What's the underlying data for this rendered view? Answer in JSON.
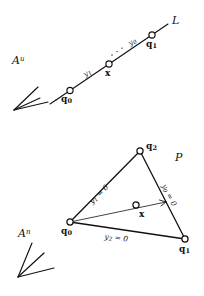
{
  "figure": {
    "ink_color": "#111111",
    "background_color": "#ffffff"
  },
  "top_panel": {
    "space_label": "A",
    "space_superscript": "u",
    "line_label": "L",
    "points": [
      {
        "name": "q0",
        "label": "q",
        "sub": "0"
      },
      {
        "name": "x",
        "label": "x",
        "sub": ""
      },
      {
        "name": "q1",
        "label": "q",
        "sub": "1"
      }
    ],
    "segment_labels": [
      {
        "name": "y1",
        "label": "y",
        "sub": "1"
      },
      {
        "name": "y0",
        "label": "y",
        "sub": "0"
      }
    ]
  },
  "bottom_panel": {
    "space_label": "A",
    "space_superscript": "n",
    "region_label": "P",
    "points": [
      {
        "name": "q0",
        "label": "q",
        "sub": "0"
      },
      {
        "name": "q1",
        "label": "q",
        "sub": "1"
      },
      {
        "name": "q2",
        "label": "q",
        "sub": "2"
      },
      {
        "name": "x",
        "label": "x",
        "sub": ""
      }
    ],
    "edge_labels": [
      {
        "name": "edge-q0-q2",
        "label": "y",
        "sub": "1",
        "equals": " = 0"
      },
      {
        "name": "edge-q1-q2",
        "label": "y",
        "sub": "0",
        "equals": " = 0"
      },
      {
        "name": "edge-q0-q1",
        "label": "y",
        "sub": "2",
        "equals": " = 0"
      }
    ]
  }
}
